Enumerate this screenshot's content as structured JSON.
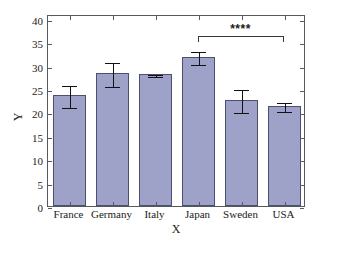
{
  "chart_data": {
    "type": "bar",
    "title": "",
    "xlabel": "X",
    "ylabel": "Y",
    "categories": [
      "France",
      "Germany",
      "Italy",
      "Japan",
      "Sweden",
      "USA"
    ],
    "values": [
      23.8,
      28.5,
      28.1,
      31.9,
      22.7,
      21.4
    ],
    "errors_upper": [
      2.3,
      2.5,
      0.2,
      1.5,
      2.5,
      1.1
    ],
    "errors_lower": [
      2.4,
      2.6,
      0.2,
      1.4,
      2.5,
      1.0
    ],
    "ylim": [
      0,
      41
    ],
    "yticks": [
      0,
      5,
      10,
      15,
      20,
      25,
      30,
      35,
      40
    ],
    "ytick_labels": [
      "0",
      "5",
      "10",
      "15",
      "20",
      "25",
      "30",
      "35",
      "40"
    ],
    "grid": false,
    "legend": "none",
    "bar_color": "#9ea2c8",
    "bar_edge_color": "#4b4f6b",
    "errorbar_color": "#111111",
    "axis_color": "#555a60",
    "background": "#ffffff",
    "annotations": [
      {
        "type": "significance-bracket",
        "label": "****",
        "from_category": "Japan",
        "to_category": "USA",
        "y": 36.5
      }
    ]
  }
}
